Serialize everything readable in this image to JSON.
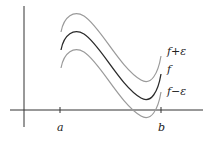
{
  "diagram": {
    "type": "epsilon-band around function",
    "axes": {
      "x_tick_labels": [
        "a",
        "b"
      ]
    },
    "curves": [
      {
        "id": "upper",
        "label": "f+ε",
        "color": "#9a9a9a"
      },
      {
        "id": "middle",
        "label": "f",
        "color": "#2a2a2a"
      },
      {
        "id": "lower",
        "label": "f−ε",
        "color": "#9a9a9a"
      }
    ]
  }
}
